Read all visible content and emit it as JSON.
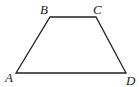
{
  "diagram": {
    "type": "trapezoid",
    "vertices": [
      {
        "name": "A",
        "x": 16,
        "y": 73,
        "label_x": 5,
        "label_y": 82
      },
      {
        "name": "B",
        "x": 50,
        "y": 17,
        "label_x": 40,
        "label_y": 14
      },
      {
        "name": "C",
        "x": 96,
        "y": 17,
        "label_x": 93,
        "label_y": 14
      },
      {
        "name": "D",
        "x": 126,
        "y": 73,
        "label_x": 126,
        "label_y": 85
      }
    ],
    "stroke_color": "#222222"
  },
  "labels": {
    "A": "A",
    "B": "B",
    "C": "C",
    "D": "D"
  }
}
